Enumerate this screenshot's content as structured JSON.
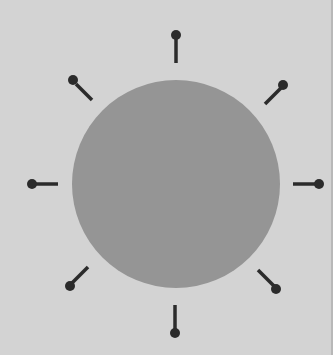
{
  "diagram": {
    "type": "circle-with-radial-pins",
    "colors": {
      "background": "#d3d3d3",
      "circle": "#959595",
      "pin": "#2b2b2b",
      "edge": "#b8b8b8"
    },
    "circle": {
      "cx": 176,
      "cy": 184,
      "r": 104
    },
    "pins": [
      {
        "name": "pin-top",
        "x1": 176,
        "y1": 63,
        "x2": 176,
        "y2": 38,
        "bx": 176,
        "by": 35
      },
      {
        "name": "pin-top-right",
        "x1": 265,
        "y1": 104,
        "x2": 281,
        "y2": 88,
        "bx": 283,
        "by": 85
      },
      {
        "name": "pin-right",
        "x1": 293,
        "y1": 184,
        "x2": 316,
        "y2": 184,
        "bx": 319,
        "by": 184
      },
      {
        "name": "pin-bottom-right",
        "x1": 258,
        "y1": 270,
        "x2": 274,
        "y2": 286,
        "bx": 276,
        "by": 289
      },
      {
        "name": "pin-bottom",
        "x1": 175,
        "y1": 305,
        "x2": 175,
        "y2": 330,
        "bx": 175,
        "by": 333
      },
      {
        "name": "pin-bottom-left",
        "x1": 88,
        "y1": 267,
        "x2": 72,
        "y2": 283,
        "bx": 70,
        "by": 286
      },
      {
        "name": "pin-left",
        "x1": 58,
        "y1": 184,
        "x2": 35,
        "y2": 184,
        "bx": 32,
        "by": 184
      },
      {
        "name": "pin-top-left",
        "x1": 92,
        "y1": 100,
        "x2": 76,
        "y2": 84,
        "bx": 73,
        "by": 80
      }
    ],
    "pin_stroke_width": 3.5,
    "pin_ball_radius": 5
  }
}
